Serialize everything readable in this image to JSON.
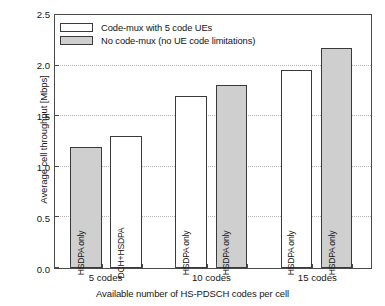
{
  "chart_data": {
    "type": "bar",
    "title": "",
    "xlabel": "Available number of HS-PDSCH codes per cell",
    "ylabel": "Average cell throughput [Mbps]",
    "categories": [
      "5 codes",
      "10 codes",
      "15 codes"
    ],
    "ylim": [
      0.0,
      2.5
    ],
    "yticks": [
      "0.0",
      "0.5",
      "1.0",
      "1.5",
      "2.0",
      "2.5"
    ],
    "ytick_values": [
      0.0,
      0.5,
      1.0,
      1.5,
      2.0,
      2.5
    ],
    "grid": true,
    "legend_position": "upper-left-inside",
    "legend": [
      {
        "label": "Code-mux with 5 code UEs",
        "style": "white",
        "color": "#ffffff"
      },
      {
        "label": "No code-mux (no UE code limitations)",
        "style": "gray",
        "color": "#cfcfcf"
      }
    ],
    "bars": [
      {
        "group": "5 codes",
        "style": "gray",
        "value": 1.2,
        "label": "HSDPA only",
        "series": "No code-mux (no UE code limitations)"
      },
      {
        "group": "5 codes",
        "style": "white",
        "value": 1.3,
        "label": "DCH+HSDPA",
        "series": "Code-mux with 5 code UEs"
      },
      {
        "group": "10 codes",
        "style": "white",
        "value": 1.7,
        "label": "HSDPA only",
        "series": "Code-mux with 5 code UEs"
      },
      {
        "group": "10 codes",
        "style": "gray",
        "value": 1.81,
        "label": "HSDPA only",
        "series": "No code-mux (no UE code limitations)"
      },
      {
        "group": "15 codes",
        "style": "white",
        "value": 1.96,
        "label": "HSDPA only",
        "series": "Code-mux with 5 code UEs"
      },
      {
        "group": "15 codes",
        "style": "gray",
        "value": 2.17,
        "label": "HSDPA only",
        "series": "No code-mux (no UE code limitations)"
      }
    ],
    "bar_x_centers_pct": [
      9.8,
      22.5,
      43.1,
      55.8,
      76.4,
      89.1
    ],
    "bar_width_pct": 10.0,
    "group_x_centers_pct": [
      16.2,
      49.5,
      82.8
    ],
    "colors": {
      "axis": "#4a4a4a",
      "grid": "#b4b4b4",
      "bar_edge": "#3a3a3a",
      "bar_fill_white": "#ffffff",
      "bar_fill_gray": "#cfcfcf",
      "text": "#161616",
      "background": "#ffffff"
    }
  }
}
